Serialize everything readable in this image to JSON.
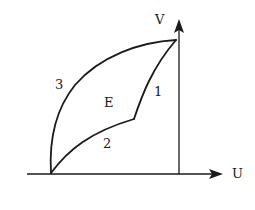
{
  "diagram": {
    "axes": {
      "x_label": "U",
      "y_label": "V"
    },
    "curves": [
      {
        "label": "1",
        "description": "curve from kink point up to top vertex"
      },
      {
        "label": "2",
        "description": "curve from origin point to kink point"
      },
      {
        "label": "3",
        "description": "outer concave arc from origin point to top vertex"
      }
    ],
    "region_label": "E",
    "colors": {
      "ink": "#1a1a1a",
      "background": "#ffffff"
    }
  }
}
